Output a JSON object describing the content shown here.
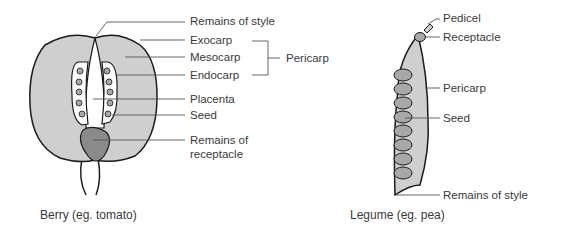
{
  "berry": {
    "caption": "Berry (eg. tomato)",
    "labels": {
      "style": "Remains of style",
      "exocarp": "Exocarp",
      "mesocarp": "Mesocarp",
      "endocarp": "Endocarp",
      "pericarp": "Pericarp",
      "placenta": "Placenta",
      "seed": "Seed",
      "receptacle_1": "Remains of",
      "receptacle_2": "receptacle"
    }
  },
  "legume": {
    "caption": "Legume (eg. pea)",
    "labels": {
      "pedicel": "Pedicel",
      "receptacle": "Receptacle",
      "pericarp": "Pericarp",
      "seed": "Seed",
      "style": "Remains of style"
    }
  },
  "colors": {
    "flesh": "#cfcfcf",
    "seed": "#a8a8a8",
    "receptacle": "#8a8a8a",
    "outline": "#1a1a1a",
    "leader": "#555555"
  }
}
